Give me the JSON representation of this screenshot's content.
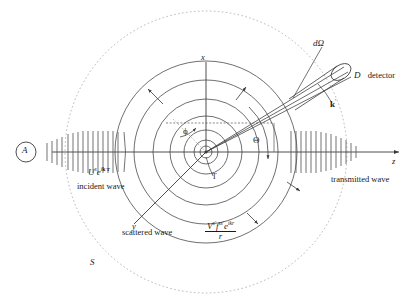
{
  "figure": {
    "type": "quantum-scattering-diagram",
    "stroke_color": "#3a3a3a",
    "dash_color": "#9a9a9a",
    "text_color": "#1a1a1a"
  },
  "source": {
    "label": "A",
    "name": "source-circle"
  },
  "incident": {
    "formula_main": "U",
    "formula_sup1": "s",
    "formula_e": "e",
    "formula_exp": "i",
    "formula_exp_k": "k",
    "formula_exp_dot": "·",
    "formula_exp_r": "r",
    "caption": "incident wave"
  },
  "transmitted": {
    "caption": "transmitted wave"
  },
  "scattered": {
    "caption": "scattered wave",
    "num_V": "V",
    "num_V_sup": "s′",
    "num_f": "f",
    "num_f_sup": "ss′",
    "num_e": "e",
    "num_e_sup": "ikr",
    "den": "r"
  },
  "axes": {
    "x": "x",
    "y": "y",
    "z": "z"
  },
  "angles": {
    "theta": "Θ",
    "phi": "ϕ"
  },
  "target": {
    "label": "T"
  },
  "detector": {
    "symbol": "D",
    "caption": "detector",
    "solid_angle": "dΩ",
    "wavevector_k": "k",
    "wavevector_prime": "′"
  },
  "surface": {
    "label": "S"
  }
}
